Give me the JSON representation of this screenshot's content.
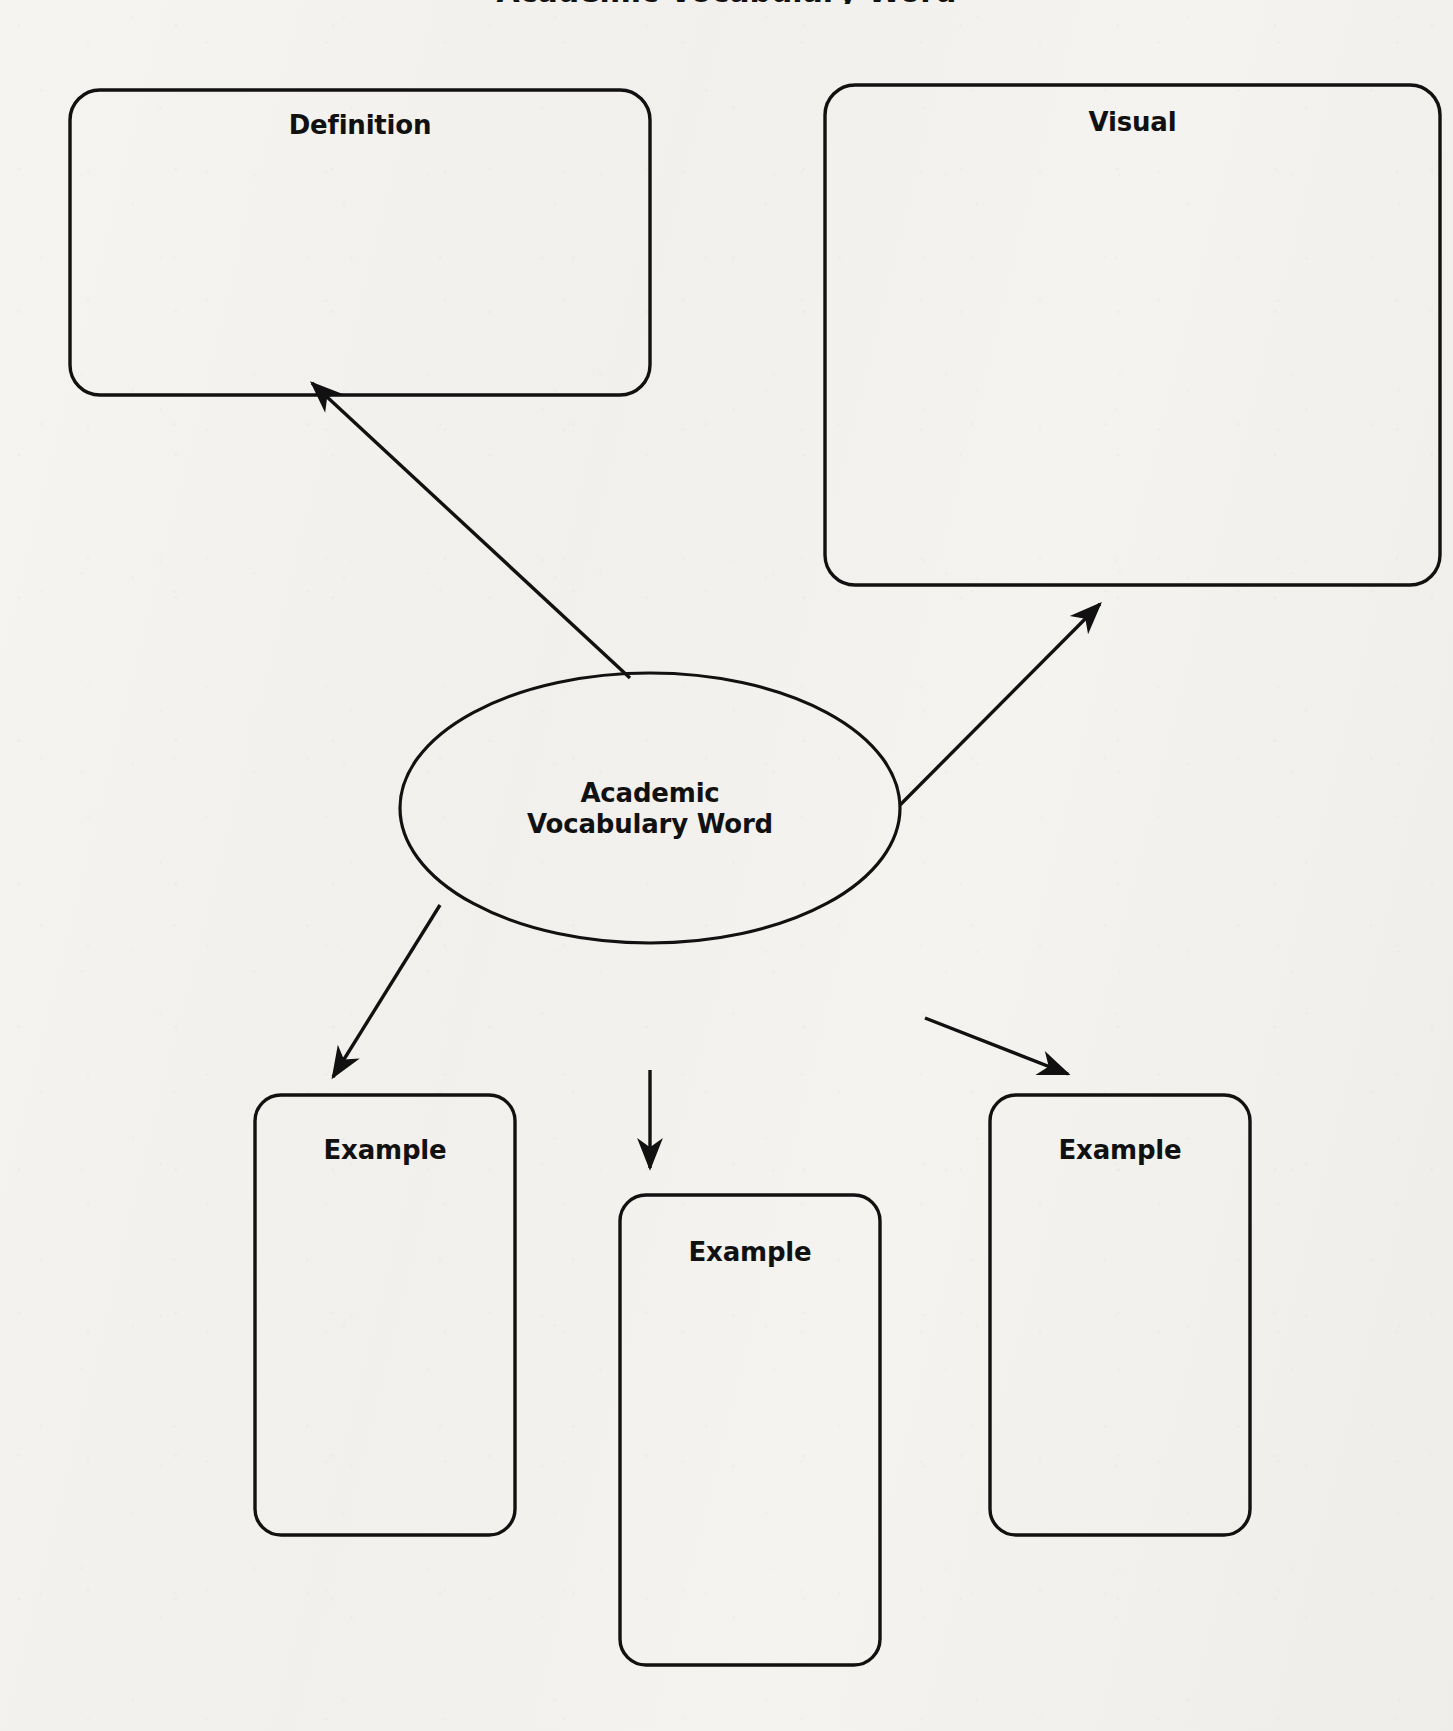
{
  "page": {
    "title_cut_off": "Academic Vocabulary Word",
    "background_color": "#f3f2ee",
    "ink_color": "#111111",
    "width": 1453,
    "height": 1731
  },
  "diagram": {
    "type": "word-map-graphic-organizer",
    "center": {
      "label": "Academic\nVocabulary Word",
      "shape": "ellipse",
      "cx": 650,
      "cy": 808,
      "rx": 250,
      "ry": 135
    },
    "nodes": [
      {
        "id": "definition",
        "label": "Definition",
        "shape": "rounded-rect",
        "x": 70,
        "y": 90,
        "w": 580,
        "h": 305,
        "r": 30,
        "label_y": 123
      },
      {
        "id": "visual",
        "label": "Visual",
        "shape": "rounded-rect",
        "x": 825,
        "y": 85,
        "w": 615,
        "h": 500,
        "r": 30,
        "label_y": 120
      },
      {
        "id": "example-left",
        "label": "Example",
        "shape": "rounded-rect",
        "x": 255,
        "y": 1095,
        "w": 260,
        "h": 440,
        "r": 26,
        "label_y": 1148
      },
      {
        "id": "example-middle",
        "label": "Example",
        "shape": "rounded-rect",
        "x": 620,
        "y": 1195,
        "w": 260,
        "h": 470,
        "r": 26,
        "label_y": 1250
      },
      {
        "id": "example-right",
        "label": "Example",
        "shape": "rounded-rect",
        "x": 990,
        "y": 1095,
        "w": 260,
        "h": 440,
        "r": 26,
        "label_y": 1148
      }
    ],
    "connectors": [
      {
        "id": "center-to-definition",
        "from": "center",
        "to": "definition",
        "x1": 630,
        "y1": 678,
        "x2": 312,
        "y2": 383,
        "arrow": "end"
      },
      {
        "id": "center-to-visual",
        "from": "center",
        "to": "visual",
        "x1": 900,
        "y1": 805,
        "x2": 1100,
        "y2": 604,
        "arrow": "end"
      },
      {
        "id": "center-to-example-left",
        "from": "center",
        "to": "example-left",
        "x1": 440,
        "y1": 905,
        "x2": 333,
        "y2": 1077,
        "arrow": "end"
      },
      {
        "id": "center-to-example-middle",
        "from": "center",
        "to": "example-middle",
        "x1": 650,
        "y1": 1070,
        "x2": 650,
        "y2": 1168,
        "arrow": "end"
      },
      {
        "id": "center-to-example-right",
        "from": "center",
        "to": "example-right",
        "x1": 925,
        "y1": 1018,
        "x2": 1068,
        "y2": 1074,
        "arrow": "end"
      }
    ]
  }
}
